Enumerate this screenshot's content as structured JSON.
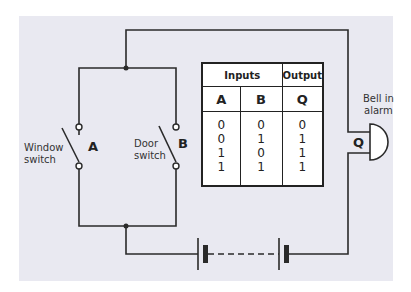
{
  "diagram": {
    "type": "OR gate burglar alarm circuit",
    "switches": [
      {
        "label": "Window switch",
        "line1": "Window",
        "line2": "switch",
        "letter": "A"
      },
      {
        "label": "Door switch",
        "line1": "Door",
        "line2": "switch",
        "letter": "B"
      }
    ],
    "bell": {
      "line1": "Bell in",
      "line2": "alarm",
      "letter": "Q"
    },
    "battery": {
      "cells": 2,
      "connector": "dashed"
    }
  },
  "truth_table": {
    "group_headers": [
      "Inputs",
      "Output"
    ],
    "columns": [
      "A",
      "B",
      "Q"
    ],
    "rows": [
      [
        "0",
        "0",
        "0"
      ],
      [
        "0",
        "1",
        "1"
      ],
      [
        "1",
        "0",
        "1"
      ],
      [
        "1",
        "1",
        "1"
      ]
    ]
  },
  "colors": {
    "background": "#e9e9f1",
    "line": "#222222",
    "table_bg": "#ffffff"
  }
}
